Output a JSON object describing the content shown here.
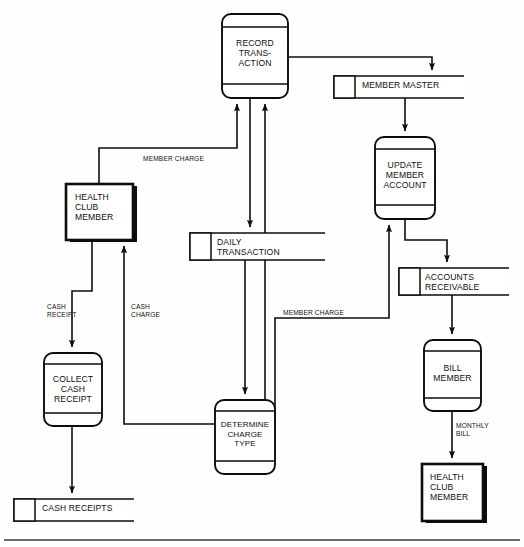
{
  "diagram": {
    "type": "data-flow-diagram",
    "colors": {
      "ink": "#0d0d0d",
      "background": "#fefefe",
      "shadow": "#0d0d0d"
    },
    "processes": [
      {
        "id": "record-transaction",
        "label": "RECORD\nTRANS-\nACTION",
        "x": 222,
        "y": 14,
        "w": 66,
        "h": 84,
        "top_divider": 13,
        "bottom_divider": 70
      },
      {
        "id": "update-member-account",
        "label": "UPDATE\nMEMBER\nACCOUNT",
        "x": 375,
        "y": 137,
        "w": 60,
        "h": 82,
        "top_divider": 12,
        "bottom_divider": 68
      },
      {
        "id": "collect-cash-receipt",
        "label": "COLLECT\nCASH\nRECEIPT",
        "x": 44,
        "y": 353,
        "w": 58,
        "h": 73,
        "top_divider": 11,
        "bottom_divider": 60
      },
      {
        "id": "determine-charge-type",
        "label": "DETERMINE\nCHARGE\nTYPE",
        "x": 215,
        "y": 400,
        "w": 60,
        "h": 74,
        "top_divider": 11,
        "bottom_divider": 61
      },
      {
        "id": "bill-member",
        "label": "BILL\nMEMBER",
        "x": 424,
        "y": 340,
        "w": 57,
        "h": 71,
        "top_divider": 11,
        "bottom_divider": 58
      }
    ],
    "data_stores": [
      {
        "id": "member-master",
        "label": "MEMBER MASTER",
        "x": 334,
        "y": 76,
        "w": 130,
        "h": 22,
        "idbox_w": 21
      },
      {
        "id": "daily-transaction",
        "label": "DAILY\nTRANSACTION",
        "x": 190,
        "y": 233,
        "w": 135,
        "h": 27,
        "idbox_w": 21
      },
      {
        "id": "accounts-receivable",
        "label": "ACCOUNTS\nRECEIVABLE",
        "x": 399,
        "y": 268,
        "w": 110,
        "h": 27,
        "idbox_w": 21
      },
      {
        "id": "cash-receipts",
        "label": "CASH RECEIPTS",
        "x": 14,
        "y": 499,
        "w": 120,
        "h": 22,
        "idbox_w": 21
      }
    ],
    "external_entities": [
      {
        "id": "health-club-member-top",
        "label": "HEALTH\nCLUB\nMEMBER",
        "x": 66,
        "y": 184,
        "w": 67,
        "h": 56
      },
      {
        "id": "health-club-member-bottom",
        "label": "HEALTH\nCLUB\nMEMBER",
        "x": 422,
        "y": 464,
        "w": 61,
        "h": 57
      }
    ],
    "flow_labels": [
      {
        "id": "member-charge-upper",
        "text": "MEMBER CHARGE",
        "x": 143,
        "y": 157
      },
      {
        "id": "member-charge-lower",
        "text": "MEMBER CHARGE",
        "x": 283,
        "y": 310
      },
      {
        "id": "cash-receipt",
        "text": "CASH\nRECEIPT",
        "x": 47,
        "y": 305
      },
      {
        "id": "cash-charge",
        "text": "CASH\nCHARGE",
        "x": 131,
        "y": 305
      },
      {
        "id": "monthly-bill",
        "text": "MONTHLY\nBILL",
        "x": 456,
        "y": 424
      }
    ],
    "flows": [
      {
        "id": "record-to-member-master",
        "from": "record-transaction",
        "to": "member-master"
      },
      {
        "id": "member-master-to-update",
        "from": "member-master",
        "to": "update-member-account"
      },
      {
        "id": "update-to-accounts-receivable",
        "from": "update-member-account",
        "to": "accounts-receivable"
      },
      {
        "id": "accounts-receivable-to-bill",
        "from": "accounts-receivable",
        "to": "bill-member"
      },
      {
        "id": "bill-to-member-entity",
        "from": "bill-member",
        "to": "health-club-member-bottom",
        "label": "MONTHLY BILL"
      },
      {
        "id": "member-charge-to-record",
        "from": "health-club-member-top",
        "to": "record-transaction",
        "label": "MEMBER CHARGE"
      },
      {
        "id": "record-to-daily-transaction",
        "from": "record-transaction",
        "to": "daily-transaction"
      },
      {
        "id": "daily-transaction-to-determine",
        "from": "daily-transaction",
        "to": "determine-charge-type"
      },
      {
        "id": "determine-to-record",
        "from": "determine-charge-type",
        "to": "record-transaction"
      },
      {
        "id": "determine-to-update",
        "from": "determine-charge-type",
        "to": "update-member-account",
        "label": "MEMBER CHARGE"
      },
      {
        "id": "member-to-collect-cash",
        "from": "health-club-member-top",
        "to": "collect-cash-receipt",
        "label": "CASH RECEIPT"
      },
      {
        "id": "determine-to-member-cash-charge",
        "from": "determine-charge-type",
        "to": "health-club-member-top",
        "label": "CASH CHARGE"
      },
      {
        "id": "collect-to-cash-receipts",
        "from": "collect-cash-receipt",
        "to": "cash-receipts"
      }
    ]
  }
}
